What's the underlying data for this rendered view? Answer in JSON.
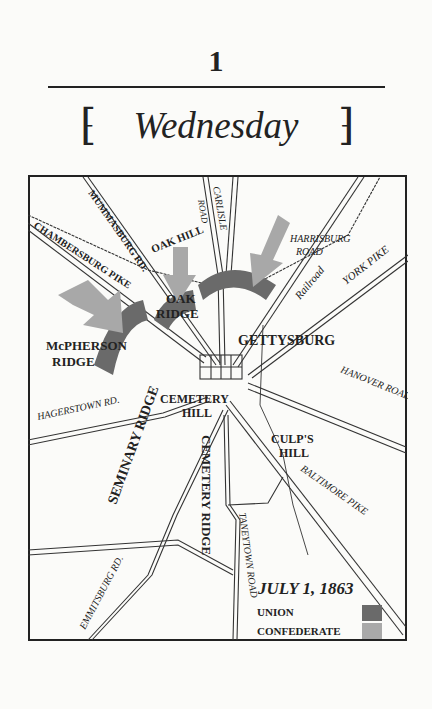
{
  "chapter": {
    "number": "1",
    "day": "Wednesday"
  },
  "map": {
    "labels": {
      "mummasburg": "MUMMASBURG RD.",
      "carlisle_road": "ROAD",
      "carlisle": "CARLISLE",
      "oak_hill": "OAK HILL",
      "harrisburg_1": "HARRISBURG",
      "harrisburg_2": "ROAD",
      "chambersburg": "CHAMBERSBURG PIKE",
      "oak_ridge_1": "OAK",
      "oak_ridge_2": "RIDGE",
      "railroad": "Railroad",
      "york": "YORK PIKE",
      "mcpherson_1": "McPHERSON",
      "mcpherson_2": "RIDGE",
      "gettysburg": "GETTYSBURG",
      "hanover": "HANOVER ROAD",
      "hagerstown": "HAGERSTOWN RD.",
      "cemetery_hill_1": "CEMETERY",
      "cemetery_hill_2": "HILL",
      "culps_1": "CULP'S",
      "culps_2": "HILL",
      "seminary": "SEMINARY RIDGE",
      "baltimore": "BALTIMORE PIKE",
      "cemetery_ridge": "CEMETERY RIDGE",
      "taneytown": "TANEYTOWN ROAD",
      "emmitsburg": "EMMITSBURG RD."
    },
    "legend": {
      "date": "JULY 1, 1863",
      "items": [
        {
          "label": "UNION",
          "color": "#6a6a6a"
        },
        {
          "label": "CONFEDERATE",
          "color": "#a9a9a9"
        }
      ]
    }
  }
}
